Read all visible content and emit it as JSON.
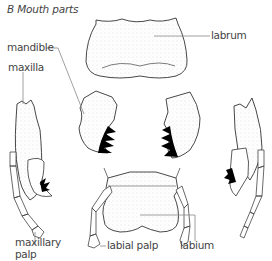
{
  "title": "B  Mouth parts",
  "labels": {
    "labrum": "labrum",
    "mandible": "mandible",
    "maxilla": "maxilla",
    "maxillary_palp_1": "maxillary",
    "maxillary_palp_2": "palp",
    "labial_palp": "labial palp",
    "labium": "labium"
  },
  "colors": {
    "outline": "#333333",
    "leader_line": "#888888",
    "teeth": "#000000",
    "stipple": "#cccccc"
  }
}
